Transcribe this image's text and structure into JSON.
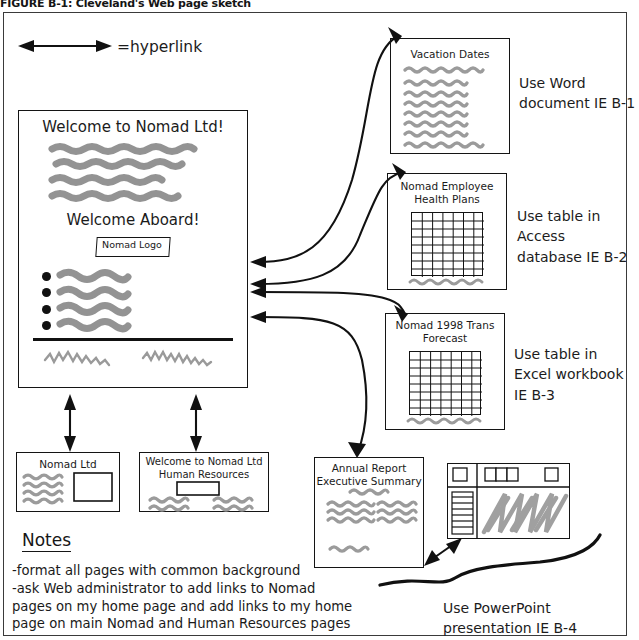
{
  "figure": {
    "caption": "FIGURE B-1: Cleveland's Web page sketch"
  },
  "legend": {
    "icon": "double-headed-arrow-icon",
    "text": "=hyperlink"
  },
  "home_page": {
    "heading": "Welcome to Nomad Ltd!",
    "subheading": "Welcome Aboard!",
    "logo_placeholder": "Nomad Logo",
    "body_lines": 4,
    "bullet_count": 4,
    "footer_squiggles": 2
  },
  "linked_pages": [
    {
      "id": "vacation-dates",
      "title": "Vacation Dates",
      "caption": "Use Word\ndocument IE B-1",
      "content": "squiggle-lines",
      "lines": 8
    },
    {
      "id": "health-plans",
      "title": "Nomad Employee\nHealth Plans",
      "caption": "Use table in\nAccess\ndatabase IE B-2",
      "content": "grid-table",
      "grid": {
        "cols": 7,
        "rows": 8
      }
    },
    {
      "id": "trans-forecast",
      "title": "Nomad 1998 Trans\nForecast",
      "caption": "Use table in\nExcel workbook\nIE B-3",
      "content": "grid-table",
      "grid": {
        "cols": 7,
        "rows": 8
      }
    }
  ],
  "bottom_pages": [
    {
      "id": "nomad-ltd",
      "title": "Nomad Ltd"
    },
    {
      "id": "nomad-hr",
      "title": "Welcome to Nomad Ltd\nHuman Resources"
    }
  ],
  "annual_report": {
    "title": "Annual Report\nExecutive Summary"
  },
  "presentation": {
    "caption": "Use PowerPoint\npresentation IE B-4",
    "mock": "slide-editor-window"
  },
  "notes": {
    "heading": "Notes",
    "body": "-format all pages with common background\n-ask Web administrator to add links to Nomad\npages on my home page and add links to my home\npage on main Nomad and Human Resources pages"
  },
  "colors": {
    "ink": "#111111",
    "marker": "#939393",
    "paper": "#ffffff",
    "frame": "#3a3a3a"
  }
}
